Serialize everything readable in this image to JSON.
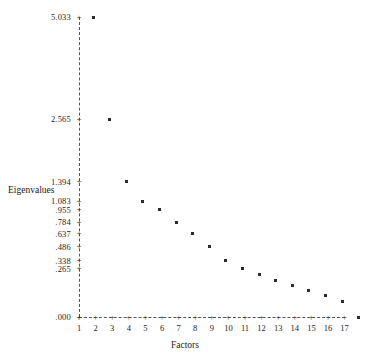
{
  "chart_data": {
    "type": "line",
    "title": "",
    "xlabel": "Factors",
    "ylabel": "Eigenvalues",
    "categories": [
      1,
      2,
      3,
      4,
      5,
      6,
      7,
      8,
      9,
      10,
      11,
      12,
      13,
      14,
      15,
      16,
      17
    ],
    "values": [
      5.033,
      2.565,
      1.394,
      1.083,
      0.955,
      0.784,
      0.637,
      0.486,
      0.338,
      0.265,
      0.212,
      0.168,
      0.132,
      0.101,
      0.071,
      0.041,
      0.0
    ],
    "xlim": [
      1,
      17
    ],
    "ylim": [
      0.0,
      5.033
    ],
    "grid": false,
    "legend": null,
    "marker": "square",
    "yticks": [
      {
        "value": 5.033,
        "label": "5.033"
      },
      {
        "value": 2.565,
        "label": "2.565"
      },
      {
        "value": 1.394,
        "label": "1.394"
      },
      {
        "value": 1.083,
        "label": "1.083"
      },
      {
        "value": 0.955,
        "label": ".955"
      },
      {
        "value": 0.784,
        "label": ".784"
      },
      {
        "value": 0.637,
        "label": ".637"
      },
      {
        "value": 0.486,
        "label": ".486"
      },
      {
        "value": 0.338,
        "label": ".338"
      },
      {
        "value": 0.265,
        "label": ".265"
      },
      {
        "value": 0.0,
        "label": ".000"
      }
    ],
    "xticks": [
      "1",
      "2",
      "3",
      "4",
      "5",
      "6",
      "7",
      "8",
      "9",
      "10",
      "11",
      "12",
      "13",
      "14",
      "15",
      "16",
      "17"
    ],
    "tick_glyph": "+",
    "axis_color": "#555555",
    "point_color": "#2b2b2b"
  }
}
